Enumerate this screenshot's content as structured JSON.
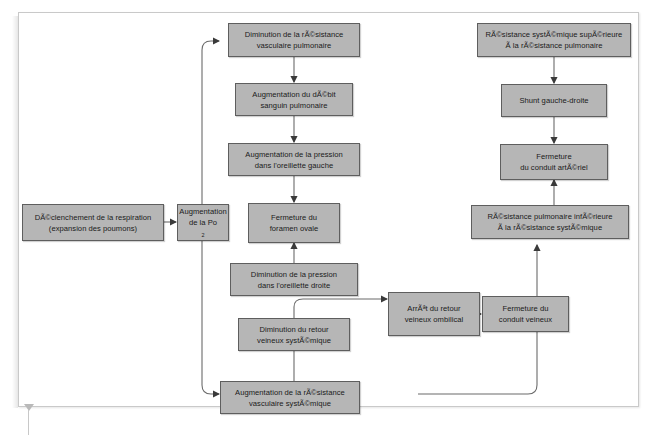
{
  "diagram": {
    "box_fill": "#b6b6b6",
    "box_stroke": "#5e5e5e",
    "line_color": "#6b6b6b",
    "page_background": "#ffffff",
    "nodes": [
      {
        "id": "trigger",
        "label_line1": "DÃ©clenchement de la respiration",
        "label_line2": "(expansion des poumons)"
      },
      {
        "id": "po2",
        "label_line1": "Augmentation",
        "label_line2": "de la Po",
        "subscript": "2"
      },
      {
        "id": "pvr_down",
        "label_line1": "Diminution de la rÃ©sistance",
        "label_line2": "vasculaire pulmonaire"
      },
      {
        "id": "flow_up",
        "label_line1": "Augmentation du dÃ©bit",
        "label_line2": "sanguin pulmonaire"
      },
      {
        "id": "la_pressure_up",
        "label_line1": "Augmentation de la pression",
        "label_line2": "dans l'oreillette gauche"
      },
      {
        "id": "foramen",
        "label_line1": "Fermeture du",
        "label_line2": "foramen ovale"
      },
      {
        "id": "ra_pressure_dn",
        "label_line1": "Diminution de la pression",
        "label_line2": "dans l'oreillette droite"
      },
      {
        "id": "venous_return",
        "label_line1": "Diminution du retour",
        "label_line2": "veineux systÃ©mique"
      },
      {
        "id": "umbilical",
        "label_line1": "ArrÃªt du retour",
        "label_line2": "veineux ombilical"
      },
      {
        "id": "ductus_ven",
        "label_line1": "Fermeture du",
        "label_line2": "conduit veineux"
      },
      {
        "id": "svr_up",
        "label_line1": "Augmentation de la rÃ©sistance",
        "label_line2": "vasculaire systÃ©mique"
      },
      {
        "id": "svr_gt_pvr",
        "label_line1": "RÃ©sistance systÃ©mique supÃ©rieure",
        "label_line2": "Ã  la rÃ©sistance pulmonaire"
      },
      {
        "id": "shunt",
        "label_line1": "Shunt gauche-droite",
        "label_line2": ""
      },
      {
        "id": "ductus_art",
        "label_line1": "Fermeture",
        "label_line2": "du conduit artÃ©riel"
      },
      {
        "id": "pvr_lt_svr",
        "label_line1": "RÃ©sistance pulmonaire infÃ©rieure",
        "label_line2": "Ã  la rÃ©sistance systÃ©mique"
      }
    ]
  }
}
